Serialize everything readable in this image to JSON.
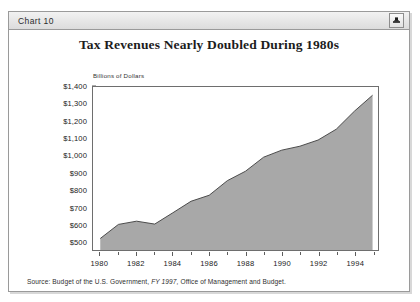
{
  "window": {
    "titlebar_label": "Chart 10",
    "titlebar_icon": "window-widget-icon"
  },
  "chart_data": {
    "type": "area",
    "title": "Tax Revenues Nearly Doubled During 1980s",
    "subtitle": "Billions of Dollars",
    "xlabel": "",
    "ylabel": "Billions of Dollars",
    "ylim": [
      450,
      1400
    ],
    "xlim": [
      1979.6,
      1995.3
    ],
    "grid": false,
    "legend": null,
    "fill_color": "#a8a8a8",
    "line_color": "#4a4a4a",
    "y_ticks": [
      1400,
      1300,
      1200,
      1100,
      1000,
      900,
      800,
      700,
      600,
      500
    ],
    "y_tick_labels": [
      "$1,400",
      "$1,300",
      "$1,200",
      "$1,100",
      "$1,000",
      "$900",
      "$800",
      "$700",
      "$600",
      "$500"
    ],
    "x_ticks": [
      1980,
      1982,
      1984,
      1986,
      1988,
      1990,
      1992,
      1994
    ],
    "x_tick_labels": [
      "1980",
      "1982",
      "1984",
      "1986",
      "1988",
      "1990",
      "1992",
      "1994"
    ],
    "x": [
      1980,
      1981,
      1982,
      1983,
      1984,
      1985,
      1986,
      1987,
      1988,
      1989,
      1990,
      1991,
      1992,
      1993,
      1994,
      1995
    ],
    "values": [
      517,
      599,
      618,
      601,
      667,
      734,
      769,
      854,
      909,
      991,
      1032,
      1055,
      1091,
      1154,
      1259,
      1352
    ],
    "series": [
      {
        "name": "Tax Revenues",
        "values": [
          517,
          599,
          618,
          601,
          667,
          734,
          769,
          854,
          909,
          991,
          1032,
          1055,
          1091,
          1154,
          1259,
          1352
        ]
      }
    ]
  },
  "source": {
    "prefix": "Source:  Budget of the U.S. Government,",
    "italic": "FY 1997,",
    "suffix": "Office of Management and Budget."
  }
}
